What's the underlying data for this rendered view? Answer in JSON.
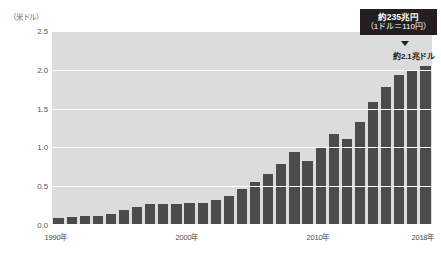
{
  "chart_data": {
    "type": "bar",
    "title": "",
    "subtitle": "",
    "xlabel": "",
    "ylabel": "（米ドル）",
    "ylim": [
      0.0,
      2.5
    ],
    "ytick_labels": [
      "2.5",
      "2.0",
      "1.5",
      "1.0",
      "0.5",
      "0.0"
    ],
    "ytick_values": [
      2.5,
      2.0,
      1.5,
      1.0,
      0.5,
      0.0
    ],
    "grid": true,
    "legend": null,
    "xtick_labels": [
      "1990年",
      "2000年",
      "2010年",
      "2018年"
    ],
    "xtick_categories": [
      "1990",
      "2000",
      "2010",
      "2018"
    ],
    "categories": [
      "1990",
      "1991",
      "1992",
      "1993",
      "1994",
      "1995",
      "1996",
      "1997",
      "1998",
      "1999",
      "2000",
      "2001",
      "2002",
      "2003",
      "2004",
      "2005",
      "2006",
      "2007",
      "2008",
      "2009",
      "2010",
      "2011",
      "2012",
      "2013",
      "2014",
      "2015",
      "2016",
      "2017",
      "2018"
    ],
    "values": [
      0.09,
      0.1,
      0.11,
      0.12,
      0.14,
      0.19,
      0.23,
      0.27,
      0.27,
      0.27,
      0.29,
      0.29,
      0.32,
      0.38,
      0.46,
      0.55,
      0.66,
      0.79,
      0.94,
      0.82,
      1.0,
      1.17,
      1.11,
      1.33,
      1.58,
      1.78,
      1.93,
      2.0,
      2.05
    ],
    "bar_color": "#4b4b4b",
    "plot_background": "#dcdcdc",
    "gridline_color": "#ffffff",
    "annotations": [
      {
        "name": "callout-box",
        "line1": "約235兆円",
        "line2": "（1ドル＝110円）",
        "background": "#231f20",
        "text_color": "#ffffff"
      },
      {
        "name": "value-note",
        "text": "約2.1兆ドル",
        "text_color": "#1a1a1a"
      }
    ]
  },
  "axis": {
    "unit_caption": "（米ドル）"
  }
}
